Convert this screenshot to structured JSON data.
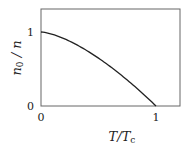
{
  "chart_data": {
    "type": "line",
    "title": "",
    "xlabel": "T/Tc",
    "ylabel": "n0 / n",
    "xlim": [
      0,
      1.2
    ],
    "ylim": [
      0,
      1.3
    ],
    "x_ticks": [
      "0",
      "1"
    ],
    "y_ticks": [
      "0",
      "1"
    ],
    "grid": false,
    "legend": null,
    "series": [
      {
        "name": "condensate fraction",
        "formula": "1 - (T/Tc)^(3/2)",
        "x": [
          0,
          0.1,
          0.2,
          0.3,
          0.4,
          0.5,
          0.6,
          0.7,
          0.8,
          0.9,
          1.0
        ],
        "values": [
          1.0,
          0.968,
          0.911,
          0.836,
          0.747,
          0.646,
          0.535,
          0.414,
          0.284,
          0.146,
          0.0
        ]
      }
    ]
  },
  "labels": {
    "x_main": "T/T",
    "x_sub": "c",
    "y_main": "n",
    "y_sub": "0",
    "y_rest": " / n",
    "tick_x0": "0",
    "tick_x1": "1",
    "tick_y0": "0",
    "tick_y1": "1"
  },
  "colors": {
    "axis": "#555555",
    "curve": "#222222"
  }
}
